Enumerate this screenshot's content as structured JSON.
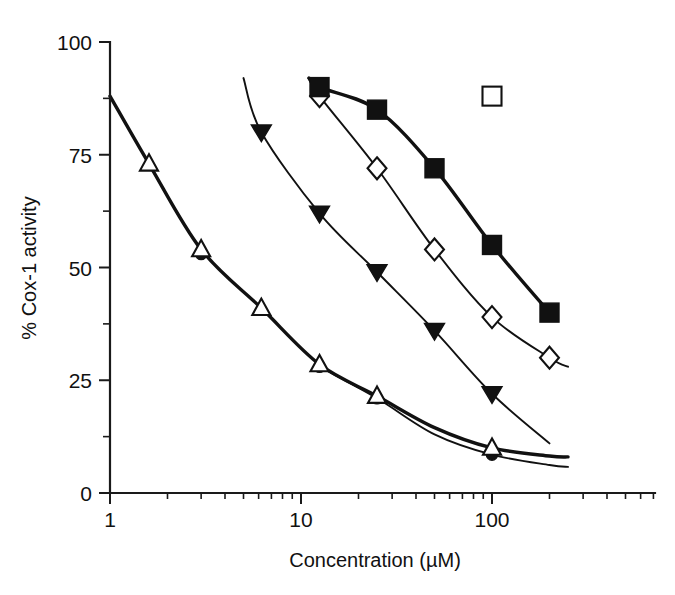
{
  "figure": {
    "background": "#ffffff",
    "ink_color": "#111111"
  },
  "chart_data": {
    "type": "line",
    "title": "",
    "subtitle": "",
    "xlabel": "Concentration (µM)",
    "ylabel": "% Cox-1 activity",
    "xscale": "log",
    "yscale": "linear",
    "xlim": [
      0.6,
      300
    ],
    "ylim": [
      0,
      100
    ],
    "grid": false,
    "legend_position": "none",
    "x_tick_labels": [
      "1",
      "10",
      "100"
    ],
    "x_tick_values": [
      1,
      10,
      100
    ],
    "y_tick_labels": [
      "0",
      "25",
      "50",
      "75",
      "100"
    ],
    "y_tick_values": [
      0,
      25,
      50,
      75,
      100
    ],
    "y_minor_tick_values": [
      12.5,
      37.5,
      62.5,
      87.5
    ],
    "annotations": [
      {
        "name": "isolated-open-square-marker",
        "marker": "open-square",
        "x": 100,
        "y": 88
      }
    ],
    "series": [
      {
        "name": "Series A",
        "marker": "open-triangle-up",
        "line_width": "thick",
        "x": [
          1.6,
          3.0,
          6.2,
          12.5,
          25,
          100
        ],
        "y": [
          73,
          54,
          41,
          28.5,
          21.5,
          10
        ],
        "curve_x": [
          1.0,
          1.6,
          3.0,
          6.2,
          12.5,
          25,
          50,
          100,
          200,
          250
        ],
        "curve_y": [
          88,
          73,
          54,
          41,
          28.5,
          21.5,
          14.5,
          10,
          8.2,
          8.0
        ]
      },
      {
        "name": "Series B",
        "marker": "filled-circle",
        "line_width": "thin",
        "x": [
          3.0,
          12.5,
          25,
          100
        ],
        "y": [
          53,
          28,
          21,
          8.5
        ],
        "curve_x": [
          12.5,
          25,
          50,
          100,
          200,
          250
        ],
        "curve_y": [
          28,
          21,
          13,
          8.5,
          6.2,
          5.8
        ]
      },
      {
        "name": "Series C",
        "marker": "filled-triangle-down",
        "line_width": "thin",
        "x": [
          6.2,
          12.5,
          25,
          50,
          100
        ],
        "y": [
          80,
          62,
          49,
          36,
          22
        ],
        "curve_x": [
          5.0,
          6.2,
          12.5,
          25,
          50,
          100,
          200
        ],
        "curve_y": [
          92,
          80,
          62,
          49,
          36,
          22,
          11
        ]
      },
      {
        "name": "Series D",
        "marker": "open-diamond",
        "line_width": "thin",
        "x": [
          12.5,
          25,
          50,
          100,
          200
        ],
        "y": [
          88,
          72,
          54,
          39,
          30
        ],
        "curve_x": [
          11.0,
          12.5,
          25,
          50,
          100,
          200,
          250
        ],
        "curve_y": [
          92,
          88,
          72,
          54,
          39,
          30,
          28
        ]
      },
      {
        "name": "Series E",
        "marker": "filled-square",
        "line_width": "thick",
        "x": [
          12.5,
          25,
          50,
          100,
          200
        ],
        "y": [
          90,
          85,
          72,
          55,
          40
        ],
        "curve_x": [
          11.0,
          12.5,
          25,
          50,
          100,
          200,
          215
        ],
        "curve_y": [
          92,
          90,
          85,
          72,
          55,
          40,
          39
        ]
      }
    ]
  }
}
